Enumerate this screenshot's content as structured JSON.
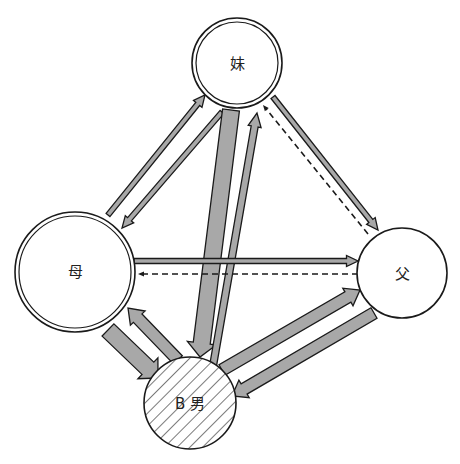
{
  "diagram": {
    "colors": {
      "stroke": "#1a1a1a",
      "arrow_fill": "#a8a8a8",
      "background": "#ffffff",
      "hatch": "#333333"
    },
    "nodes": [
      {
        "id": "sister",
        "label": "妹",
        "style": "double"
      },
      {
        "id": "mother",
        "label": "母",
        "style": "double"
      },
      {
        "id": "father",
        "label": "父",
        "style": "single"
      },
      {
        "id": "b_male",
        "label": "B 男",
        "style": "hatched"
      }
    ],
    "edges": [
      {
        "from": "mother",
        "to": "sister",
        "weight": "thin",
        "line": "solid"
      },
      {
        "from": "sister",
        "to": "mother",
        "weight": "thin",
        "line": "solid"
      },
      {
        "from": "sister",
        "to": "b_male",
        "weight": "thick",
        "line": "solid"
      },
      {
        "from": "b_male",
        "to": "sister",
        "weight": "medium-thin",
        "line": "solid"
      },
      {
        "from": "sister",
        "to": "father",
        "weight": "thin",
        "line": "solid"
      },
      {
        "from": "father",
        "to": "sister",
        "weight": "dashed",
        "line": "dashed"
      },
      {
        "from": "mother",
        "to": "father",
        "weight": "thin",
        "line": "solid"
      },
      {
        "from": "father",
        "to": "mother",
        "weight": "dashed",
        "line": "dashed"
      },
      {
        "from": "mother",
        "to": "b_male",
        "weight": "thick",
        "line": "solid"
      },
      {
        "from": "b_male",
        "to": "mother",
        "weight": "medium",
        "line": "solid"
      },
      {
        "from": "b_male",
        "to": "father",
        "weight": "medium",
        "line": "solid"
      },
      {
        "from": "father",
        "to": "b_male",
        "weight": "medium",
        "line": "solid"
      }
    ]
  }
}
